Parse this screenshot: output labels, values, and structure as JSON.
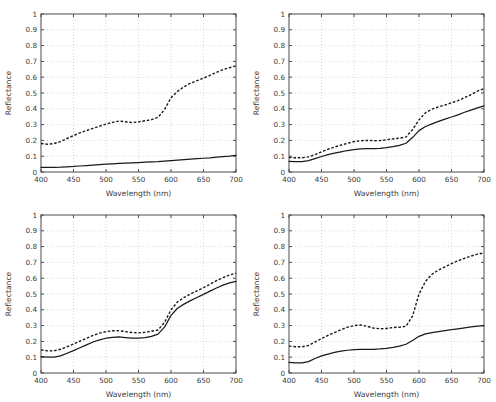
{
  "figure": {
    "background": "#ffffff",
    "rows": 2,
    "cols": 2,
    "axis_color": "#4d4d4d",
    "grid_color": "#c9c9c9",
    "line_color": "#1a1a1a"
  },
  "axis": {
    "xlabel": "Wavelength (nm)",
    "ylabel": "Reflectance",
    "xticks": [
      400,
      450,
      500,
      550,
      600,
      650,
      700
    ],
    "xtick_labels": [
      "400",
      "450",
      "500",
      "550",
      "600",
      "650",
      "700"
    ],
    "yticks": [
      0,
      0.1,
      0.2,
      0.3,
      0.4,
      0.5,
      0.6,
      0.7,
      0.8,
      0.9,
      1
    ],
    "ytick_labels": [
      "0",
      "0.1",
      "0.2",
      "0.3",
      "0.4",
      "0.5",
      "0.6",
      "0.7",
      "0.8",
      "0.9",
      "1"
    ],
    "xlim": [
      400,
      700
    ],
    "ylim": [
      0,
      1
    ],
    "grid": true
  },
  "chart_data": [
    {
      "id": "panel-top-left",
      "type": "line",
      "title": "",
      "xlabel": "Wavelength (nm)",
      "ylabel": "Reflectance",
      "xlim": [
        400,
        700
      ],
      "ylim": [
        0,
        1
      ],
      "grid": true,
      "legend": "none",
      "x": [
        400,
        410,
        420,
        430,
        440,
        450,
        460,
        470,
        480,
        490,
        500,
        510,
        520,
        530,
        540,
        550,
        560,
        570,
        580,
        590,
        600,
        610,
        620,
        630,
        640,
        650,
        660,
        670,
        680,
        690,
        700
      ],
      "series": [
        {
          "name": "solid",
          "style": "solid",
          "values": [
            0.03,
            0.03,
            0.03,
            0.031,
            0.033,
            0.035,
            0.038,
            0.041,
            0.044,
            0.047,
            0.05,
            0.052,
            0.054,
            0.056,
            0.058,
            0.06,
            0.062,
            0.064,
            0.066,
            0.069,
            0.072,
            0.075,
            0.078,
            0.081,
            0.084,
            0.087,
            0.09,
            0.094,
            0.098,
            0.101,
            0.105
          ]
        },
        {
          "name": "dashed",
          "style": "dashed",
          "values": [
            0.18,
            0.176,
            0.18,
            0.192,
            0.212,
            0.23,
            0.248,
            0.262,
            0.276,
            0.29,
            0.303,
            0.314,
            0.322,
            0.318,
            0.313,
            0.317,
            0.324,
            0.331,
            0.346,
            0.395,
            0.47,
            0.51,
            0.54,
            0.562,
            0.578,
            0.594,
            0.612,
            0.63,
            0.648,
            0.66,
            0.672
          ]
        }
      ]
    },
    {
      "id": "panel-top-right",
      "type": "line",
      "title": "",
      "xlabel": "Wavelength (nm)",
      "ylabel": "Reflectance",
      "xlim": [
        400,
        700
      ],
      "ylim": [
        0,
        1
      ],
      "grid": true,
      "legend": "none",
      "x": [
        400,
        410,
        420,
        430,
        440,
        450,
        460,
        470,
        480,
        490,
        500,
        510,
        520,
        530,
        540,
        550,
        560,
        570,
        580,
        590,
        600,
        610,
        620,
        630,
        640,
        650,
        660,
        670,
        680,
        690,
        700
      ],
      "series": [
        {
          "name": "solid",
          "style": "solid",
          "values": [
            0.068,
            0.066,
            0.066,
            0.072,
            0.085,
            0.098,
            0.11,
            0.12,
            0.128,
            0.136,
            0.142,
            0.146,
            0.148,
            0.148,
            0.15,
            0.154,
            0.16,
            0.168,
            0.182,
            0.218,
            0.262,
            0.288,
            0.305,
            0.32,
            0.335,
            0.348,
            0.362,
            0.378,
            0.392,
            0.406,
            0.418
          ]
        },
        {
          "name": "dashed",
          "style": "dashed",
          "values": [
            0.092,
            0.09,
            0.09,
            0.096,
            0.11,
            0.128,
            0.144,
            0.158,
            0.17,
            0.182,
            0.192,
            0.198,
            0.2,
            0.198,
            0.199,
            0.204,
            0.21,
            0.214,
            0.222,
            0.268,
            0.33,
            0.375,
            0.398,
            0.412,
            0.424,
            0.438,
            0.452,
            0.47,
            0.49,
            0.512,
            0.528
          ]
        }
      ]
    },
    {
      "id": "panel-bottom-left",
      "type": "line",
      "title": "",
      "xlabel": "Wavelength (nm)",
      "ylabel": "Reflectance",
      "xlim": [
        400,
        700
      ],
      "ylim": [
        0,
        1
      ],
      "grid": true,
      "legend": "none",
      "x": [
        400,
        410,
        420,
        430,
        440,
        450,
        460,
        470,
        480,
        490,
        500,
        510,
        520,
        530,
        540,
        550,
        560,
        570,
        580,
        590,
        600,
        610,
        620,
        630,
        640,
        650,
        660,
        670,
        680,
        690,
        700
      ],
      "series": [
        {
          "name": "solid",
          "style": "solid",
          "values": [
            0.103,
            0.1,
            0.1,
            0.108,
            0.125,
            0.142,
            0.16,
            0.178,
            0.196,
            0.21,
            0.22,
            0.226,
            0.228,
            0.224,
            0.22,
            0.22,
            0.224,
            0.232,
            0.246,
            0.29,
            0.365,
            0.41,
            0.436,
            0.458,
            0.478,
            0.498,
            0.518,
            0.538,
            0.556,
            0.57,
            0.58
          ]
        },
        {
          "name": "dashed",
          "style": "dashed",
          "values": [
            0.146,
            0.14,
            0.141,
            0.15,
            0.166,
            0.183,
            0.202,
            0.22,
            0.238,
            0.252,
            0.262,
            0.267,
            0.268,
            0.262,
            0.256,
            0.254,
            0.258,
            0.264,
            0.272,
            0.32,
            0.4,
            0.45,
            0.478,
            0.5,
            0.52,
            0.54,
            0.562,
            0.584,
            0.604,
            0.62,
            0.632
          ]
        }
      ]
    },
    {
      "id": "panel-bottom-right",
      "type": "line",
      "title": "",
      "xlabel": "Wavelength (nm)",
      "ylabel": "Reflectance",
      "xlim": [
        400,
        700
      ],
      "ylim": [
        0,
        1
      ],
      "grid": true,
      "legend": "none",
      "x": [
        400,
        410,
        420,
        430,
        440,
        450,
        460,
        470,
        480,
        490,
        500,
        510,
        520,
        530,
        540,
        550,
        560,
        570,
        580,
        590,
        600,
        610,
        620,
        630,
        640,
        650,
        660,
        670,
        680,
        690,
        700
      ],
      "series": [
        {
          "name": "solid",
          "style": "solid",
          "values": [
            0.068,
            0.064,
            0.064,
            0.072,
            0.092,
            0.108,
            0.12,
            0.13,
            0.138,
            0.144,
            0.148,
            0.15,
            0.15,
            0.15,
            0.152,
            0.156,
            0.162,
            0.17,
            0.182,
            0.206,
            0.232,
            0.248,
            0.256,
            0.262,
            0.268,
            0.274,
            0.28,
            0.286,
            0.292,
            0.296,
            0.3
          ]
        },
        {
          "name": "dashed",
          "style": "dashed",
          "values": [
            0.17,
            0.166,
            0.166,
            0.174,
            0.196,
            0.218,
            0.238,
            0.256,
            0.274,
            0.29,
            0.3,
            0.304,
            0.296,
            0.284,
            0.28,
            0.282,
            0.288,
            0.29,
            0.296,
            0.36,
            0.5,
            0.58,
            0.625,
            0.652,
            0.672,
            0.692,
            0.71,
            0.726,
            0.74,
            0.752,
            0.76
          ]
        }
      ]
    }
  ]
}
